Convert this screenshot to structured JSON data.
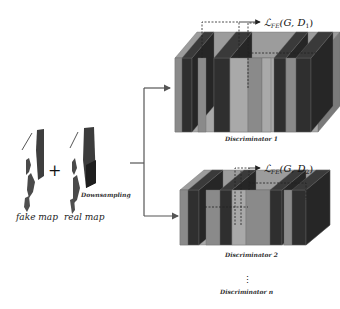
{
  "inputs": {
    "fake_label": "fake map",
    "real_label": "real map",
    "plus_symbol": "+",
    "downsampling_label": "Downsampling"
  },
  "discriminators": [
    {
      "label": "Discriminator 1",
      "loss_prefix": "ℒ",
      "loss_sub": "FE",
      "loss_args": "(G, D",
      "loss_index": "1",
      "loss_close": ")"
    },
    {
      "label": "Discriminator 2",
      "loss_prefix": "ℒ",
      "loss_sub": "FE",
      "loss_args": "(G, D",
      "loss_index": "2",
      "loss_close": ")"
    }
  ],
  "ellipsis": "⋮",
  "last_discriminator_label": "Discriminator n",
  "colors": {
    "slab_dark": "#2f2f2f",
    "slab_mid": "#8a8a8a",
    "slab_light": "#a9a9a9",
    "slab_top": "#9c9c9c",
    "arrow": "#555555",
    "map_dark": "#3a3a3a"
  }
}
